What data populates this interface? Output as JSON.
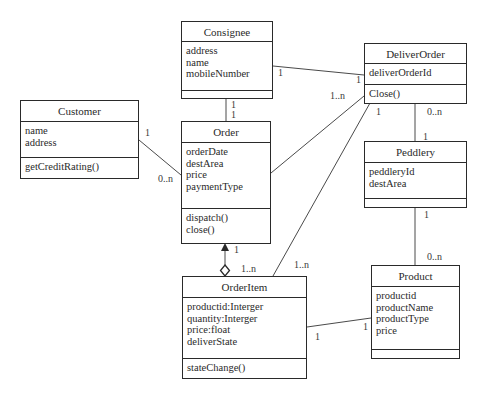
{
  "diagram": {
    "type": "UML class diagram",
    "classes": {
      "consignee": {
        "name": "Consignee",
        "attributes": [
          "address",
          "name",
          "mobileNumber"
        ],
        "operations": []
      },
      "deliverOrder": {
        "name": "DeliverOrder",
        "attributes": [
          "deliverOrderId"
        ],
        "operations": [
          "Close()"
        ]
      },
      "customer": {
        "name": "Customer",
        "attributes": [
          "name",
          "address"
        ],
        "operations": [
          "getCreditRating()"
        ]
      },
      "order": {
        "name": "Order",
        "attributes": [
          "orderDate",
          "destArea",
          "price",
          "paymentType"
        ],
        "operations": [
          "dispatch()",
          "close()"
        ]
      },
      "peddlery": {
        "name": "Peddlery",
        "attributes": [
          "peddleryId",
          "destArea"
        ],
        "operations": []
      },
      "orderItem": {
        "name": "OrderItem",
        "attributes": [
          "productid:Interger",
          "quantity:Interger",
          "price:float",
          "deliverState"
        ],
        "operations": [
          "stateChange()"
        ]
      },
      "product": {
        "name": "Product",
        "attributes": [
          "productid",
          "productName",
          "productType",
          "price"
        ],
        "operations": []
      }
    },
    "associations": {
      "consignee_deliverOrder": {
        "from": "Consignee",
        "to": "DeliverOrder",
        "from_mult": "1",
        "to_mult": "1"
      },
      "consignee_order": {
        "from": "Consignee",
        "to": "Order",
        "from_mult": "1",
        "to_mult": "1"
      },
      "customer_order": {
        "from": "Customer",
        "to": "Order",
        "from_mult": "1",
        "to_mult": "0..n"
      },
      "order_deliverOrder": {
        "from": "Order",
        "to": "DeliverOrder",
        "from_mult": "",
        "to_mult": "1..n"
      },
      "deliverOrder_peddlery": {
        "from": "DeliverOrder",
        "to": "Peddlery",
        "from_mult": "0..n",
        "to_mult": "1"
      },
      "deliverOrder_orderItem": {
        "from": "DeliverOrder",
        "to": "OrderItem",
        "from_mult": "1",
        "to_mult": "1..n"
      },
      "order_orderItem": {
        "from": "Order",
        "to": "OrderItem",
        "from_mult": "1",
        "to_mult": "1..n",
        "kind": "aggregation"
      },
      "peddlery_product": {
        "from": "Peddlery",
        "to": "Product",
        "from_mult": "1",
        "to_mult": "0..n"
      },
      "orderItem_product": {
        "from": "OrderItem",
        "to": "Product",
        "from_mult": "1",
        "to_mult": "1"
      }
    }
  }
}
